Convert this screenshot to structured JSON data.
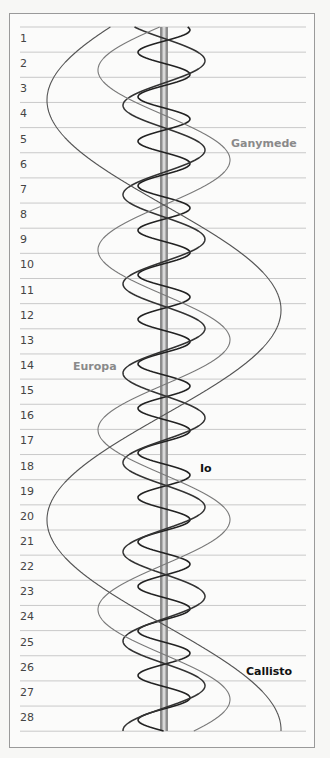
{
  "chart_data": {
    "type": "line",
    "title": "",
    "xlabel": "",
    "ylabel": "Day",
    "orientation": "vertical time axis (days 1–28 top to bottom), horizontal = apparent east-west offset from Jupiter",
    "days": [
      1,
      2,
      3,
      4,
      5,
      6,
      7,
      8,
      9,
      10,
      11,
      12,
      13,
      14,
      15,
      16,
      17,
      18,
      19,
      20,
      21,
      22,
      23,
      24,
      25,
      26,
      27,
      28
    ],
    "grid": true,
    "center_object": "Jupiter",
    "series": [
      {
        "name": "Io",
        "color": "#222222",
        "label_color": "#111111",
        "amplitude_px": 26,
        "period_days": 1.77,
        "stroke": "dark"
      },
      {
        "name": "Europa",
        "color": "#333333",
        "label_color": "#8a8a8a",
        "amplitude_px": 41,
        "period_days": 3.55,
        "stroke": "dark"
      },
      {
        "name": "Ganymede",
        "color": "#7a7a7a",
        "label_color": "#8a8a8a",
        "amplitude_px": 66,
        "period_days": 7.15,
        "stroke": "light"
      },
      {
        "name": "Callisto",
        "color": "#555555",
        "label_color": "#111111",
        "amplitude_px": 117,
        "period_days": 16.69,
        "stroke": "medium"
      }
    ],
    "annotations": [
      {
        "text": "Ganymede",
        "day": 5
      },
      {
        "text": "Europa",
        "day": 14
      },
      {
        "text": "Io",
        "day": 18
      },
      {
        "text": "Callisto",
        "day": 26
      }
    ]
  },
  "labels": {
    "ganymede": "Ganymede",
    "europa": "Europa",
    "io": "Io",
    "callisto": "Callisto"
  },
  "days": [
    "1",
    "2",
    "3",
    "4",
    "5",
    "6",
    "7",
    "8",
    "9",
    "10",
    "11",
    "12",
    "13",
    "14",
    "15",
    "16",
    "17",
    "18",
    "19",
    "20",
    "21",
    "22",
    "23",
    "24",
    "25",
    "26",
    "27",
    "28"
  ]
}
